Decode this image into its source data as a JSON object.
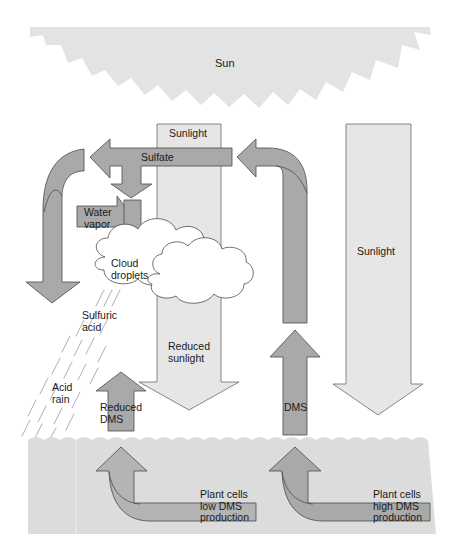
{
  "diagram": {
    "colors": {
      "sun": "#e3e3e3",
      "sunlight_light": "#e6e6e6",
      "arrow_dark": "#a9a9a9",
      "ocean": "#dcdcdc",
      "outline": "#4a4a4a",
      "cloud_fill": "#ffffff"
    },
    "labels": {
      "sun": "Sun",
      "sunlight_top": "Sunlight",
      "sulfate": "Sulfate",
      "water_vapor": "Water\nvapor",
      "cloud_droplets": "Cloud\ndroplets",
      "sunlight_right": "Sunlight",
      "sulfuric_acid": "Sulfuric\nacid",
      "reduced_sunlight": "Reduced\nsunlight",
      "acid_rain": "Acid\nrain",
      "reduced_dms": "Reduced\nDMS",
      "dms": "DMS",
      "plant_low": "Plant cells\nlow DMS\nproduction",
      "plant_high": "Plant cells\nhigh DMS\nproduction"
    },
    "nodes": [
      {
        "id": "sun",
        "label": "Sun"
      },
      {
        "id": "sunlight",
        "label": "Sunlight"
      },
      {
        "id": "sulfate",
        "label": "Sulfate"
      },
      {
        "id": "water_vapor",
        "label": "Water vapor"
      },
      {
        "id": "cloud_droplets",
        "label": "Cloud droplets"
      },
      {
        "id": "sulfuric_acid",
        "label": "Sulfuric acid"
      },
      {
        "id": "acid_rain",
        "label": "Acid rain"
      },
      {
        "id": "reduced_sunlight",
        "label": "Reduced sunlight"
      },
      {
        "id": "reduced_dms",
        "label": "Reduced DMS"
      },
      {
        "id": "dms",
        "label": "DMS"
      },
      {
        "id": "plant_low",
        "label": "Plant cells low DMS production"
      },
      {
        "id": "plant_high",
        "label": "Plant cells high DMS production"
      }
    ],
    "edges": [
      {
        "from": "sun",
        "to": "plant_high",
        "label": "Sunlight"
      },
      {
        "from": "plant_high",
        "to": "dms"
      },
      {
        "from": "dms",
        "to": "sulfate"
      },
      {
        "from": "sulfate",
        "to": "cloud_droplets"
      },
      {
        "from": "water_vapor",
        "to": "cloud_droplets"
      },
      {
        "from": "sulfate",
        "to": "sulfuric_acid"
      },
      {
        "from": "sulfuric_acid",
        "to": "acid_rain"
      },
      {
        "from": "cloud_droplets",
        "to": "reduced_sunlight"
      },
      {
        "from": "reduced_sunlight",
        "to": "plant_low"
      },
      {
        "from": "plant_low",
        "to": "reduced_dms"
      }
    ]
  }
}
